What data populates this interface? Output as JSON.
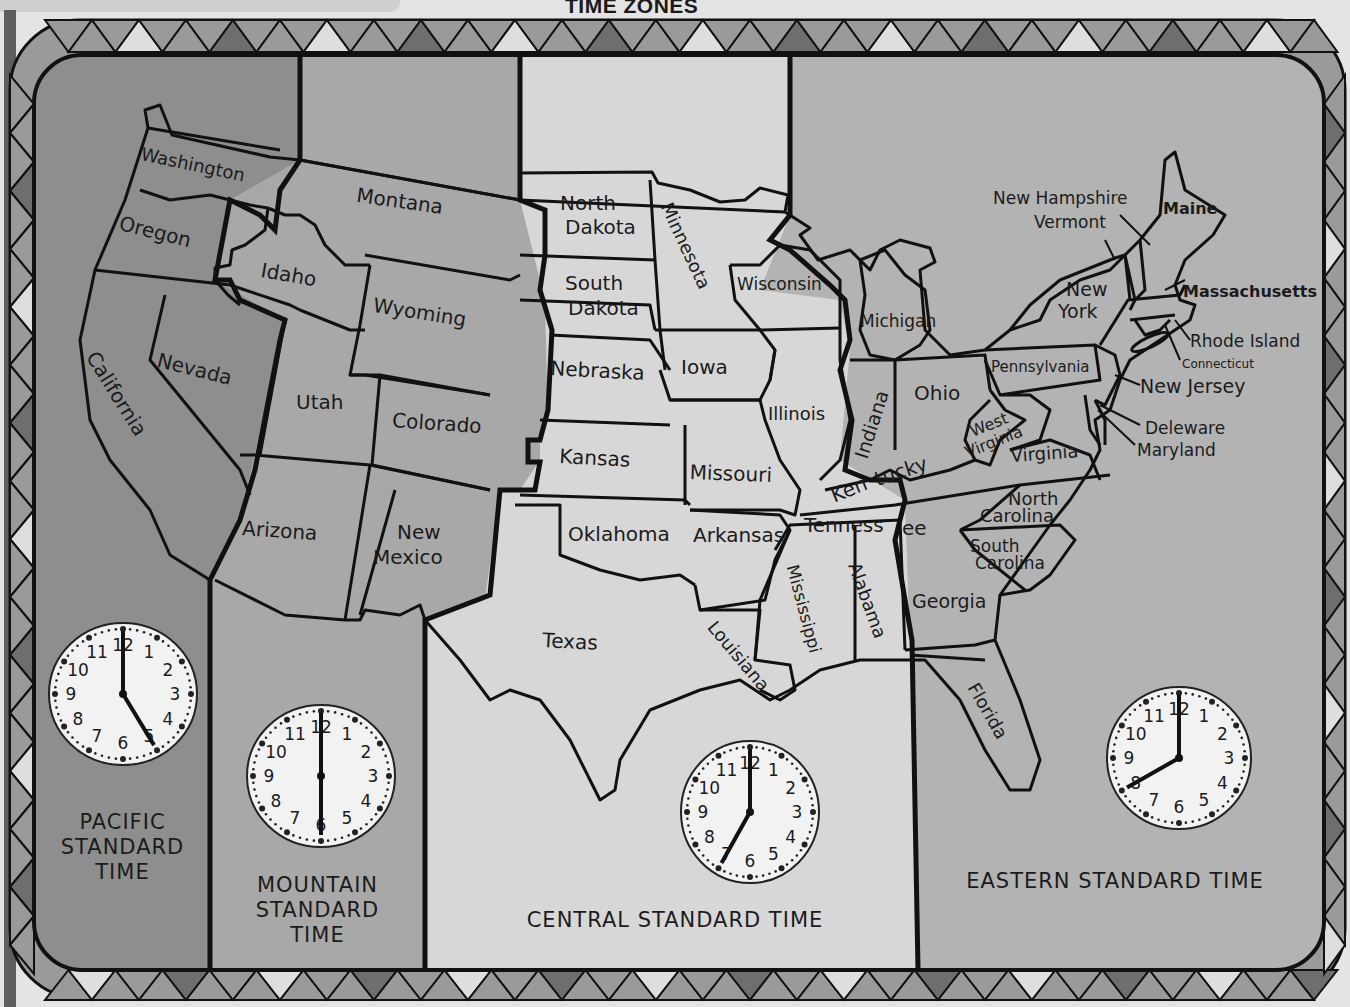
{
  "title": "TIME ZONES",
  "colors": {
    "pacific": "#8e8e8e",
    "mountain": "#a8a8a8",
    "central": "#d7d7d7",
    "eastern": "#b3b3b3",
    "border_dark": "#6e6e6e",
    "border_mid": "#9a9a9a",
    "border_light": "#dedede",
    "ink": "#111111"
  },
  "zones": [
    {
      "id": "pacific",
      "label_lines": [
        "PACIFIC",
        "STANDARD",
        "TIME"
      ],
      "clock": {
        "hour": 5,
        "minute": 0,
        "display": "5:00"
      }
    },
    {
      "id": "mountain",
      "label_lines": [
        "MOUNTAIN",
        "STANDARD",
        "TIME"
      ],
      "clock": {
        "hour": 6,
        "minute": 0,
        "display": "6:00"
      }
    },
    {
      "id": "central",
      "label_lines": [
        "CENTRAL STANDARD TIME"
      ],
      "clock": {
        "hour": 7,
        "minute": 0,
        "display": "7:00"
      }
    },
    {
      "id": "eastern",
      "label_lines": [
        "EASTERN STANDARD TIME"
      ],
      "clock": {
        "hour": 8,
        "minute": 0,
        "display": "8:00"
      }
    }
  ],
  "clock_numerals": [
    "12",
    "1",
    "2",
    "3",
    "4",
    "5",
    "6",
    "7",
    "8",
    "9",
    "10",
    "11"
  ],
  "states": {
    "washington": "Washington",
    "oregon": "Oregon",
    "california": "California",
    "nevada": "Nevada",
    "idaho": "Idaho",
    "montana": "Montana",
    "wyoming": "Wyoming",
    "utah": "Utah",
    "colorado": "Colorado",
    "arizona": "Arizona",
    "new_mexico_1": "New",
    "new_mexico_2": "Mexico",
    "north_dakota_1": "North",
    "north_dakota_2": "Dakota",
    "south_dakota_1": "South",
    "south_dakota_2": "Dakota",
    "nebraska": "Nebraska",
    "kansas": "Kansas",
    "oklahoma": "Oklahoma",
    "texas": "Texas",
    "minnesota": "Minnesota",
    "iowa": "Iowa",
    "missouri": "Missouri",
    "arkansas": "Arkansas",
    "louisiana": "Louisiana",
    "wisconsin": "Wisconsin",
    "illinois": "Illinois",
    "mississippi": "Mississippi",
    "alabama": "Alabama",
    "tennessee_1": "Tenness",
    "tennessee_2": "ee",
    "kentucky_1": "Ken",
    "kentucky_2": "tucky",
    "michigan": "Michigan",
    "indiana": "Indiana",
    "ohio": "Ohio",
    "west_virginia_1": "West",
    "west_virginia_2": "Virginia",
    "virginia": "Virginia",
    "north_carolina_1": "North",
    "north_carolina_2": "Carolina",
    "south_carolina_1": "South",
    "south_carolina_2": "Carolina",
    "georgia": "Georgia",
    "florida": "Florida",
    "pennsylvania": "Pennsylvania",
    "new_york_1": "New",
    "new_york_2": "York",
    "new_hampshire": "New Hampshire",
    "vermont": "Vermont",
    "maine": "Maine",
    "massachusetts": "Massachusetts",
    "rhode_island": "Rhode Island",
    "connecticut": "Connecticut",
    "new_jersey": "New Jersey",
    "delaware": "Deleware",
    "maryland": "Maryland"
  }
}
